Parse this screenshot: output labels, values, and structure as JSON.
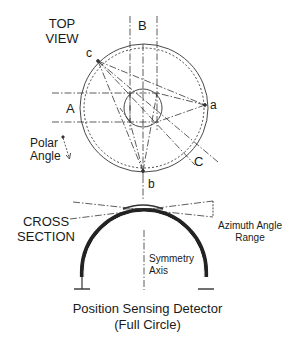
{
  "labels": {
    "top_view_line1": "TOP",
    "top_view_line2": "VIEW",
    "B": "B",
    "c": "c",
    "A": "A",
    "a": "a",
    "polar_line1": "Polar",
    "polar_line2": "Angle",
    "C": "C",
    "b": "b",
    "cross_line1": "CROSS",
    "cross_line2": "SECTION",
    "azimuth_line1": "Azimuth Angle",
    "azimuth_line2": "Range",
    "symmetry_line1": "Symmetry",
    "symmetry_line2": "Axis",
    "caption_line1": "Position Sensing Detector",
    "caption_line2": "(Full Circle)"
  },
  "colors": {
    "line": "#333333",
    "background": "#ffffff"
  }
}
